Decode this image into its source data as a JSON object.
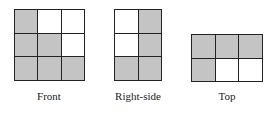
{
  "colors": {
    "filled": "#c4c4c4",
    "empty": "#ffffff",
    "line": "#222222"
  },
  "views": [
    {
      "id": "front",
      "label": "Front",
      "rows": 3,
      "cols": 3,
      "cells": [
        [
          "filled",
          "empty",
          "empty"
        ],
        [
          "filled",
          "filled",
          "empty"
        ],
        [
          "filled",
          "filled",
          "filled"
        ]
      ]
    },
    {
      "id": "right-side",
      "label": "Right-side",
      "rows": 3,
      "cols": 2,
      "cells": [
        [
          "empty",
          "filled"
        ],
        [
          "empty",
          "filled"
        ],
        [
          "filled",
          "filled"
        ]
      ]
    },
    {
      "id": "top",
      "label": "Top",
      "rows": 2,
      "cols": 3,
      "cells": [
        [
          "filled",
          "filled",
          "filled"
        ],
        [
          "filled",
          "empty",
          "empty"
        ]
      ]
    }
  ]
}
